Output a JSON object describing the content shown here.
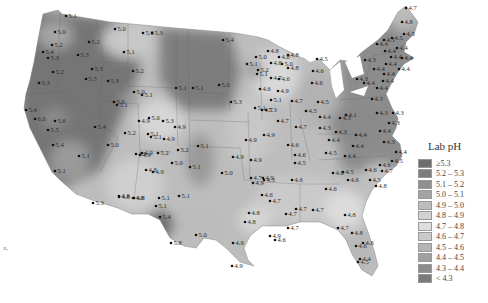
{
  "map": {
    "title": "Lab pH",
    "region": "Contiguous United States",
    "legend": {
      "title": "Lab pH",
      "items": [
        {
          "label": "≥5.3",
          "color": "#6e6e6e"
        },
        {
          "label": "5.2 – 5.3",
          "color": "#7d7d7d"
        },
        {
          "label": "5.1 – 5.2",
          "color": "#8f8f8f"
        },
        {
          "label": "5.0 – 5.1",
          "color": "#a4a4a4"
        },
        {
          "label": "4.9 – 5.0",
          "color": "#bdbdbd"
        },
        {
          "label": "4.8 – 4.9",
          "color": "#d2d2d2"
        },
        {
          "label": "4.7 – 4.8",
          "color": "#dedede"
        },
        {
          "label": "4.6 – 4.7",
          "color": "#cacaca"
        },
        {
          "label": "4.5 – 4.6",
          "color": "#b4b4b4"
        },
        {
          "label": "4.4 – 4.5",
          "color": "#a0a0a0"
        },
        {
          "label": "4.3 – 4.4",
          "color": "#8c8c8c"
        },
        {
          "label": "< 4.3",
          "color": "#7a7a7a"
        }
      ]
    },
    "stray_mark": "x,",
    "sites": [
      {
        "x": 66,
        "y": 16,
        "v": "5.1"
      },
      {
        "x": 55,
        "y": 32,
        "v": "5.0"
      },
      {
        "x": 115,
        "y": 29,
        "v": "5.0"
      },
      {
        "x": 143,
        "y": 33,
        "v": "5.3"
      },
      {
        "x": 52,
        "y": 45,
        "v": "5.2"
      },
      {
        "x": 89,
        "y": 42,
        "v": "5.2"
      },
      {
        "x": 43,
        "y": 52,
        "v": "5.4"
      },
      {
        "x": 48,
        "y": 58,
        "v": "5.3"
      },
      {
        "x": 124,
        "y": 52,
        "v": "5.1"
      },
      {
        "x": 78,
        "y": 55,
        "v": "5.3"
      },
      {
        "x": 92,
        "y": 69,
        "v": "5.3"
      },
      {
        "x": 53,
        "y": 72,
        "v": "5.2"
      },
      {
        "x": 86,
        "y": 79,
        "v": "5.5"
      },
      {
        "x": 108,
        "y": 81,
        "v": "5.3"
      },
      {
        "x": 39,
        "y": 83,
        "v": "5.3"
      },
      {
        "x": 133,
        "y": 71,
        "v": "5.2"
      },
      {
        "x": 134,
        "y": 92,
        "v": "5.0"
      },
      {
        "x": 142,
        "y": 95,
        "v": "5.1"
      },
      {
        "x": 114,
        "y": 102,
        "v": "5.0"
      },
      {
        "x": 117,
        "y": 105,
        "v": "5.1"
      },
      {
        "x": 26,
        "y": 110,
        "v": "5.4"
      },
      {
        "x": 35,
        "y": 119,
        "v": "6.0"
      },
      {
        "x": 55,
        "y": 121,
        "v": "5.6"
      },
      {
        "x": 48,
        "y": 130,
        "v": "5.5"
      },
      {
        "x": 95,
        "y": 127,
        "v": "5.4"
      },
      {
        "x": 125,
        "y": 133,
        "v": "5.2"
      },
      {
        "x": 53,
        "y": 145,
        "v": "5.4"
      },
      {
        "x": 108,
        "y": 145,
        "v": "5.0"
      },
      {
        "x": 79,
        "y": 156,
        "v": "5.1"
      },
      {
        "x": 136,
        "y": 154,
        "v": "4.9"
      },
      {
        "x": 55,
        "y": 171,
        "v": "5.1"
      },
      {
        "x": 93,
        "y": 203,
        "v": "5.3"
      },
      {
        "x": 119,
        "y": 197,
        "v": "4.8"
      },
      {
        "x": 133,
        "y": 198,
        "v": "4.8"
      },
      {
        "x": 139,
        "y": 121,
        "v": "4.9"
      },
      {
        "x": 149,
        "y": 118,
        "v": "5.0"
      },
      {
        "x": 163,
        "y": 121,
        "v": "5.3"
      },
      {
        "x": 148,
        "y": 134,
        "v": "5.1"
      },
      {
        "x": 151,
        "y": 137,
        "v": "5.1"
      },
      {
        "x": 164,
        "y": 139,
        "v": "4.9"
      },
      {
        "x": 142,
        "y": 153,
        "v": "4.9"
      },
      {
        "x": 158,
        "y": 153,
        "v": "5.2"
      },
      {
        "x": 178,
        "y": 150,
        "v": "5.2"
      },
      {
        "x": 175,
        "y": 127,
        "v": "4.9"
      },
      {
        "x": 140,
        "y": 155,
        "v": "4.9"
      },
      {
        "x": 146,
        "y": 170,
        "v": "4.8"
      },
      {
        "x": 153,
        "y": 172,
        "v": "4.9"
      },
      {
        "x": 172,
        "y": 163,
        "v": "5.0"
      },
      {
        "x": 190,
        "y": 167,
        "v": "5.1"
      },
      {
        "x": 119,
        "y": 196,
        "v": "4.8"
      },
      {
        "x": 134,
        "y": 198,
        "v": "4.8"
      },
      {
        "x": 159,
        "y": 198,
        "v": "5.1"
      },
      {
        "x": 179,
        "y": 196,
        "v": "5.1"
      },
      {
        "x": 156,
        "y": 206,
        "v": "5.1"
      },
      {
        "x": 160,
        "y": 217,
        "v": "5.4"
      },
      {
        "x": 171,
        "y": 243,
        "v": "5.8"
      },
      {
        "x": 196,
        "y": 235,
        "v": "5.0"
      },
      {
        "x": 152,
        "y": 33,
        "v": "5.3"
      },
      {
        "x": 223,
        "y": 40,
        "v": "5.4"
      },
      {
        "x": 176,
        "y": 88,
        "v": "5.1"
      },
      {
        "x": 193,
        "y": 88,
        "v": "5.1"
      },
      {
        "x": 219,
        "y": 85,
        "v": "5.0"
      },
      {
        "x": 198,
        "y": 146,
        "v": "5.1"
      },
      {
        "x": 231,
        "y": 102,
        "v": "5.3"
      },
      {
        "x": 255,
        "y": 108,
        "v": "5.1"
      },
      {
        "x": 264,
        "y": 135,
        "v": "4.9"
      },
      {
        "x": 266,
        "y": 110,
        "v": "5.3"
      },
      {
        "x": 251,
        "y": 160,
        "v": "4.9"
      },
      {
        "x": 263,
        "y": 178,
        "v": "4.9"
      },
      {
        "x": 222,
        "y": 173,
        "v": "5.0"
      },
      {
        "x": 233,
        "y": 157,
        "v": "4.9"
      },
      {
        "x": 253,
        "y": 183,
        "v": "4.9"
      },
      {
        "x": 256,
        "y": 57,
        "v": "5.0"
      },
      {
        "x": 268,
        "y": 51,
        "v": "4.8"
      },
      {
        "x": 279,
        "y": 57,
        "v": "4.8"
      },
      {
        "x": 288,
        "y": 55,
        "v": "4.8"
      },
      {
        "x": 271,
        "y": 63,
        "v": "4.8"
      },
      {
        "x": 282,
        "y": 64,
        "v": "5.0"
      },
      {
        "x": 288,
        "y": 68,
        "v": "4.8"
      },
      {
        "x": 247,
        "y": 64,
        "v": "5.1"
      },
      {
        "x": 257,
        "y": 74,
        "v": "5.1"
      },
      {
        "x": 258,
        "y": 70,
        "v": "5.2"
      },
      {
        "x": 271,
        "y": 78,
        "v": "4.7"
      },
      {
        "x": 279,
        "y": 79,
        "v": "4.6"
      },
      {
        "x": 260,
        "y": 89,
        "v": "4.6"
      },
      {
        "x": 278,
        "y": 91,
        "v": "4.9"
      },
      {
        "x": 271,
        "y": 100,
        "v": "5.1"
      },
      {
        "x": 292,
        "y": 101,
        "v": "4.7"
      },
      {
        "x": 262,
        "y": 110,
        "v": "4.7"
      },
      {
        "x": 278,
        "y": 121,
        "v": "4.7"
      },
      {
        "x": 317,
        "y": 59,
        "v": "4.5"
      },
      {
        "x": 313,
        "y": 71,
        "v": "4.6"
      },
      {
        "x": 312,
        "y": 83,
        "v": "4.6"
      },
      {
        "x": 318,
        "y": 102,
        "v": "4.5"
      },
      {
        "x": 306,
        "y": 111,
        "v": "4.5"
      },
      {
        "x": 320,
        "y": 117,
        "v": "4.4"
      },
      {
        "x": 340,
        "y": 118,
        "v": "4.3"
      },
      {
        "x": 346,
        "y": 115,
        "v": "4.1"
      },
      {
        "x": 296,
        "y": 127,
        "v": "4.7"
      },
      {
        "x": 246,
        "y": 140,
        "v": "4.9"
      },
      {
        "x": 288,
        "y": 145,
        "v": "4.6"
      },
      {
        "x": 295,
        "y": 155,
        "v": "4.6"
      },
      {
        "x": 295,
        "y": 163,
        "v": "4.5"
      },
      {
        "x": 320,
        "y": 128,
        "v": "4.3"
      },
      {
        "x": 329,
        "y": 140,
        "v": "4.4"
      },
      {
        "x": 336,
        "y": 132,
        "v": "4.3"
      },
      {
        "x": 326,
        "y": 153,
        "v": "4.5"
      },
      {
        "x": 345,
        "y": 156,
        "v": "4.4"
      },
      {
        "x": 353,
        "y": 146,
        "v": "4.4"
      },
      {
        "x": 251,
        "y": 178,
        "v": "4.7"
      },
      {
        "x": 264,
        "y": 180,
        "v": "4.3"
      },
      {
        "x": 292,
        "y": 180,
        "v": "4.6"
      },
      {
        "x": 262,
        "y": 195,
        "v": "4.6"
      },
      {
        "x": 270,
        "y": 201,
        "v": "4.7"
      },
      {
        "x": 326,
        "y": 189,
        "v": "4.6"
      },
      {
        "x": 343,
        "y": 172,
        "v": "4.5"
      },
      {
        "x": 333,
        "y": 173,
        "v": "4.6"
      },
      {
        "x": 348,
        "y": 180,
        "v": "4.6"
      },
      {
        "x": 366,
        "y": 170,
        "v": "4.6"
      },
      {
        "x": 249,
        "y": 213,
        "v": "4.8"
      },
      {
        "x": 245,
        "y": 222,
        "v": "4.8"
      },
      {
        "x": 270,
        "y": 236,
        "v": "4.9"
      },
      {
        "x": 233,
        "y": 243,
        "v": "4.9"
      },
      {
        "x": 232,
        "y": 266,
        "v": "4.9"
      },
      {
        "x": 286,
        "y": 214,
        "v": "4.7"
      },
      {
        "x": 296,
        "y": 209,
        "v": "4.7"
      },
      {
        "x": 313,
        "y": 210,
        "v": "4.7"
      },
      {
        "x": 288,
        "y": 228,
        "v": "4.7"
      },
      {
        "x": 275,
        "y": 240,
        "v": "4.6"
      },
      {
        "x": 345,
        "y": 215,
        "v": "4.8"
      },
      {
        "x": 338,
        "y": 228,
        "v": "4.7"
      },
      {
        "x": 352,
        "y": 233,
        "v": "4.8"
      },
      {
        "x": 356,
        "y": 246,
        "v": "4.6"
      },
      {
        "x": 363,
        "y": 243,
        "v": "4.6"
      },
      {
        "x": 360,
        "y": 259,
        "v": "4.4"
      },
      {
        "x": 358,
        "y": 262,
        "v": "4.5"
      },
      {
        "x": 406,
        "y": 8,
        "v": "4.7"
      },
      {
        "x": 402,
        "y": 22,
        "v": "4.8"
      },
      {
        "x": 404,
        "y": 34,
        "v": "4.5"
      },
      {
        "x": 392,
        "y": 38,
        "v": "4.5"
      },
      {
        "x": 384,
        "y": 40,
        "v": "4.5"
      },
      {
        "x": 377,
        "y": 44,
        "v": "4.4"
      },
      {
        "x": 385,
        "y": 51,
        "v": "4.4"
      },
      {
        "x": 397,
        "y": 48,
        "v": "4.4"
      },
      {
        "x": 391,
        "y": 57,
        "v": "4.4"
      },
      {
        "x": 402,
        "y": 58,
        "v": "4.4"
      },
      {
        "x": 365,
        "y": 60,
        "v": "4.3"
      },
      {
        "x": 386,
        "y": 64,
        "v": "4.4"
      },
      {
        "x": 374,
        "y": 69,
        "v": "4.4"
      },
      {
        "x": 384,
        "y": 74,
        "v": "4.4"
      },
      {
        "x": 399,
        "y": 69,
        "v": "4.4"
      },
      {
        "x": 357,
        "y": 79,
        "v": "4.3"
      },
      {
        "x": 364,
        "y": 83,
        "v": "4.4"
      },
      {
        "x": 377,
        "y": 88,
        "v": "4.4"
      },
      {
        "x": 383,
        "y": 81,
        "v": "4.4"
      },
      {
        "x": 372,
        "y": 99,
        "v": "4.3"
      },
      {
        "x": 377,
        "y": 113,
        "v": "4.3"
      },
      {
        "x": 393,
        "y": 113,
        "v": "4.3"
      },
      {
        "x": 389,
        "y": 123,
        "v": "4.3"
      },
      {
        "x": 380,
        "y": 131,
        "v": "4.4"
      },
      {
        "x": 356,
        "y": 135,
        "v": "4.4"
      },
      {
        "x": 384,
        "y": 142,
        "v": "4.3"
      },
      {
        "x": 396,
        "y": 152,
        "v": "4.4"
      },
      {
        "x": 392,
        "y": 161,
        "v": "4.5"
      },
      {
        "x": 380,
        "y": 165,
        "v": "4.6"
      },
      {
        "x": 382,
        "y": 171,
        "v": "4.7"
      },
      {
        "x": 376,
        "y": 186,
        "v": "4.8"
      },
      {
        "x": 370,
        "y": 180,
        "v": "4.5"
      }
    ]
  }
}
